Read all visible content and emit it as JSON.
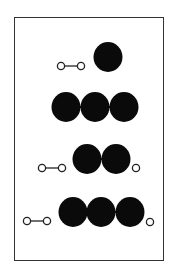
{
  "diagram": {
    "colors": {
      "filled": "#0a0a0a",
      "stroke": "#222222",
      "background": "#ffffff",
      "frame": "#333333"
    },
    "rows": [
      {
        "id": "row-1",
        "small_pairs": [
          {
            "x1": 61,
            "x2": 81,
            "y": 66
          }
        ],
        "big_spheres": [
          {
            "cx": 108,
            "cy": 57
          }
        ],
        "lone_small": []
      },
      {
        "id": "row-2",
        "small_pairs": [],
        "big_spheres": [
          {
            "cx": 66,
            "cy": 107
          },
          {
            "cx": 95,
            "cy": 107
          },
          {
            "cx": 124,
            "cy": 107
          }
        ],
        "lone_small": []
      },
      {
        "id": "row-3",
        "small_pairs": [
          {
            "x1": 42,
            "x2": 62,
            "y": 168
          }
        ],
        "big_spheres": [
          {
            "cx": 87,
            "cy": 159
          },
          {
            "cx": 116,
            "cy": 159
          }
        ],
        "lone_small": [
          {
            "cx": 136,
            "cy": 168
          }
        ]
      },
      {
        "id": "row-4",
        "small_pairs": [
          {
            "x1": 27,
            "x2": 47,
            "y": 221
          }
        ],
        "big_spheres": [
          {
            "cx": 73,
            "cy": 212
          },
          {
            "cx": 101,
            "cy": 212
          },
          {
            "cx": 130,
            "cy": 212
          }
        ],
        "lone_small": [
          {
            "cx": 150,
            "cy": 222
          }
        ]
      }
    ]
  }
}
